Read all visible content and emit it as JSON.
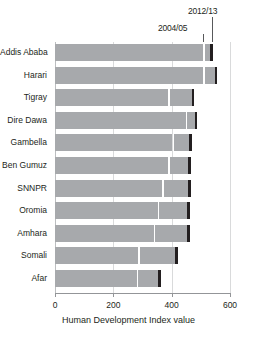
{
  "chart_data": {
    "type": "bar",
    "orientation": "horizontal",
    "title": "",
    "xlabel": "Human Development Index value",
    "ylabel": "",
    "xlim": [
      0,
      600
    ],
    "xticks": [
      0,
      200,
      400,
      600
    ],
    "xtick_labels": [
      "0",
      "200",
      "400",
      "600"
    ],
    "grid": true,
    "grid_axis": "x",
    "legend_position": "callout-annotations",
    "annotations": [
      {
        "name": "2004/05",
        "text": "2004/05",
        "role": "series-callout"
      },
      {
        "name": "2012/13",
        "text": "2012/13",
        "role": "series-callout"
      }
    ],
    "categories": [
      "Addis Ababa",
      "Harari",
      "Tigray",
      "Dire Dawa",
      "Gambella",
      "Ben Gumuz",
      "SNNPR",
      "Oromia",
      "Amhara",
      "Somali",
      "Afar"
    ],
    "series": [
      {
        "name": "2004/05",
        "values": [
          508,
          508,
          388,
          448,
          402,
          388,
          368,
          352,
          338,
          285,
          280
        ]
      },
      {
        "name": "2012/13",
        "values": [
          540,
          556,
          478,
          488,
          468,
          465,
          465,
          462,
          462,
          420,
          362
        ]
      }
    ],
    "colors": {
      "bar": "#a7a9ac",
      "endcap": "#231f20",
      "gridline": "#d9dadb",
      "axis": "#939598",
      "text": "#231f20",
      "background": "#ffffff"
    }
  },
  "axis": {
    "title": "Human Development Index value"
  },
  "callouts": {
    "early": "2004/05",
    "late": "2012/13"
  }
}
